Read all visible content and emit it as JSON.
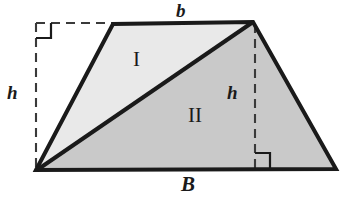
{
  "figure": {
    "background_color": "#ffffff",
    "stroke_color": "#1a1a1a",
    "dash_color": "#3a3a3a",
    "region_1_fill": "#e9e9e9",
    "region_2_fill": "#c9c9c9",
    "labels": {
      "top_base": "b",
      "bottom_base": "B",
      "height_left": "h",
      "height_right": "h",
      "region_1": "I",
      "region_2": "II"
    },
    "geometry": {
      "vertices": {
        "bottom_left": [
          36,
          170
        ],
        "top_left": [
          113,
          24
        ],
        "top_right": [
          253,
          22
        ],
        "bottom_right": [
          336,
          169
        ]
      },
      "diagonal": [
        [
          36,
          170
        ],
        [
          253,
          22
        ]
      ],
      "dashed_altitude_left": [
        [
          36,
          23
        ],
        [
          36,
          170
        ]
      ],
      "dashed_altitude_right": [
        [
          255,
          24
        ],
        [
          255,
          168
        ]
      ],
      "dashed_extension_top": [
        [
          36,
          23
        ],
        [
          113,
          23
        ]
      ],
      "right_angle_markers": [
        {
          "name": "top-left",
          "x": 36,
          "y": 23,
          "size": 15
        },
        {
          "name": "bottom-right",
          "x": 255,
          "y": 168,
          "size": 15
        }
      ]
    }
  }
}
